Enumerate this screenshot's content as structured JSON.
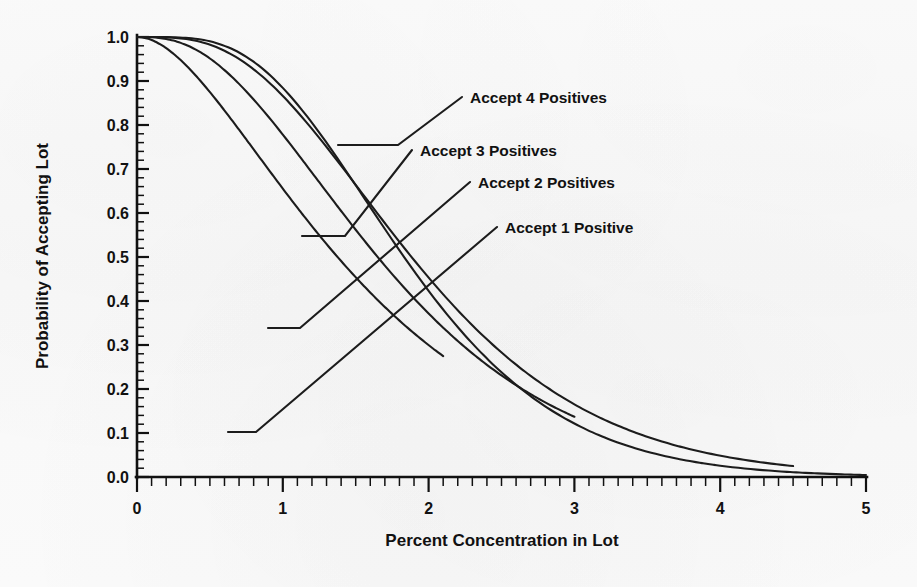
{
  "chart_data": {
    "type": "line",
    "title": "",
    "xlabel": "Percent Concentration in Lot",
    "ylabel": "Probability of Accepting Lot",
    "xlim": [
      0,
      5
    ],
    "ylim": [
      0,
      1
    ],
    "xticks": [
      "0",
      "1",
      "2",
      "3",
      "4",
      "5"
    ],
    "xtick_values": [
      0,
      1,
      2,
      3,
      4,
      5
    ],
    "yticks": [
      "0.0",
      "0.1",
      "0.2",
      "0.3",
      "0.4",
      "0.5",
      "0.6",
      "0.7",
      "0.8",
      "0.9",
      "1.0"
    ],
    "ytick_values": [
      0.0,
      0.1,
      0.2,
      0.3,
      0.4,
      0.5,
      0.6,
      0.7,
      0.8,
      0.9,
      1.0
    ],
    "x_minor_tick_step": 0.1,
    "y_minor_tick_step": 0.02,
    "grid": false,
    "legend_position": "inline-annotations",
    "series": [
      {
        "name": "Accept 1 Positive",
        "annotation": "Accept 1 Positive",
        "x": [
          0.0,
          0.1,
          0.2,
          0.3,
          0.4,
          0.5,
          0.6,
          0.7,
          0.8,
          0.88,
          1.0,
          1.2,
          1.4,
          1.6,
          1.8,
          2.0,
          2.1
        ],
        "y": [
          1.0,
          0.911,
          0.736,
          0.558,
          0.406,
          0.287,
          0.199,
          0.136,
          0.092,
          0.11,
          0.04,
          0.017,
          0.007,
          0.003,
          0.001,
          0.0,
          0.0
        ]
      },
      {
        "name": "Accept 2 Positives",
        "annotation": "Accept 2 Positives",
        "x": [
          0.0,
          0.2,
          0.4,
          0.6,
          0.8,
          1.0,
          1.2,
          1.4,
          1.6,
          1.8,
          2.0,
          2.2,
          2.4,
          2.6,
          2.8,
          3.0
        ],
        "y": [
          1.0,
          0.96,
          0.835,
          0.678,
          0.523,
          0.386,
          0.275,
          0.19,
          0.128,
          0.084,
          0.054,
          0.034,
          0.021,
          0.013,
          0.007,
          0.004
        ]
      },
      {
        "name": "Accept 3 Positives",
        "annotation": "Accept 3 Positives",
        "x": [
          0.0,
          0.25,
          0.5,
          0.75,
          1.0,
          1.25,
          1.5,
          1.75,
          2.0,
          2.25,
          2.5,
          2.75,
          3.0,
          3.5,
          4.0,
          4.5
        ],
        "y": [
          1.0,
          0.981,
          0.907,
          0.795,
          0.665,
          0.534,
          0.413,
          0.31,
          0.224,
          0.158,
          0.109,
          0.074,
          0.049,
          0.02,
          0.008,
          0.003
        ]
      },
      {
        "name": "Accept 4 Positives",
        "annotation": "Accept 4 Positives",
        "x": [
          0.0,
          0.3,
          0.6,
          0.9,
          1.2,
          1.5,
          1.8,
          2.1,
          2.4,
          2.7,
          3.0,
          3.4,
          3.8,
          4.2,
          4.6,
          5.0
        ],
        "y": [
          1.0,
          0.997,
          0.978,
          0.935,
          0.867,
          0.779,
          0.678,
          0.574,
          0.472,
          0.378,
          0.296,
          0.205,
          0.136,
          0.087,
          0.054,
          0.032
        ]
      }
    ],
    "annotations": [
      {
        "label": "Accept 4 Positives",
        "text_x": 470,
        "text_y": 103,
        "leader_start_x": 338,
        "leader_start_y": 145,
        "leader_mid_x": 398,
        "leader_mid_y": 145,
        "leader_end_x": 462,
        "leader_end_y": 97
      },
      {
        "label": "Accept 3 Positives",
        "text_x": 420,
        "text_y": 156,
        "leader_start_x": 302,
        "leader_start_y": 236,
        "leader_mid_x": 345,
        "leader_mid_y": 236,
        "leader_end_x": 412,
        "leader_end_y": 150
      },
      {
        "label": "Accept 2 Positives",
        "text_x": 478,
        "text_y": 188,
        "leader_start_x": 268,
        "leader_start_y": 328,
        "leader_mid_x": 300,
        "leader_mid_y": 328,
        "leader_end_x": 470,
        "leader_end_y": 182
      },
      {
        "label": "Accept 1 Positive",
        "text_x": 505,
        "text_y": 233,
        "leader_start_x": 228,
        "leader_start_y": 432,
        "leader_mid_x": 256,
        "leader_mid_y": 432,
        "leader_end_x": 497,
        "leader_end_y": 227
      }
    ]
  },
  "colors": {
    "background": "#fbfbfb",
    "ink": "#1c1c1c",
    "axis": "#111111"
  }
}
